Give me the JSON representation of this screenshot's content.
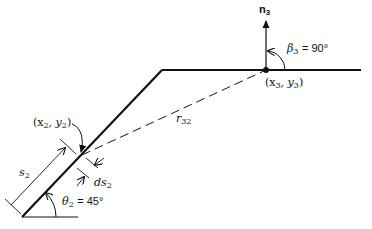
{
  "diagram": {
    "type": "geometry-schematic",
    "colors": {
      "line": "#111111",
      "background": "#ffffff"
    },
    "labels": {
      "normal": {
        "base": "n",
        "sub": "3"
      },
      "beta": {
        "symbol": "β",
        "sub": "3",
        "value": "= 90°"
      },
      "point3": {
        "open": "(x",
        "sub1": "3",
        "mid": ", y",
        "sub2": "3",
        "close": ")"
      },
      "point2": {
        "open": "(x",
        "sub1": "2",
        "mid": ", y",
        "sub2": "2",
        "close": ")"
      },
      "distance": {
        "base": "r",
        "sub": "32"
      },
      "arclength": {
        "base": "s",
        "sub": "2"
      },
      "element": {
        "base": "ds",
        "sub": "2"
      },
      "theta": {
        "symbol": "θ",
        "sub": "2",
        "value": "= 45°"
      }
    }
  }
}
